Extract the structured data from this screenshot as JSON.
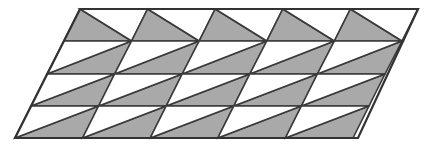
{
  "figure": {
    "title": "Parallelogram tessellation of shaded and unshaded triangles",
    "canvas": {
      "width": 440,
      "height": 148,
      "background": "#ffffff"
    }
  },
  "style": {
    "shaded_fill": "#a9a9a9",
    "unshaded_fill": "#ffffff",
    "stroke": "#3a3a3a",
    "outer_stroke": "#333333",
    "inner_stroke_width": 1.6,
    "outer_stroke_width": 2.2
  },
  "geometry": {
    "outline_points": "80,9 418,9 358,138 15,138",
    "corners": {
      "top_left": [
        80,
        9
      ],
      "top_right": [
        418,
        9
      ],
      "bottom_right": [
        358,
        138
      ],
      "bottom_left": [
        15,
        138
      ]
    },
    "columns": 5,
    "rows": 4,
    "row_y": [
      9,
      41,
      74,
      106,
      138
    ],
    "row_x_left": [
      80,
      64,
      47,
      31,
      15
    ],
    "column_width": 67.6,
    "slant_dx_per_row": -16.25
  },
  "chart_data": {
    "type": "diagram",
    "title": "Parallelogram tessellation of shaded and unshaded triangles",
    "shape": "parallelogram",
    "grid": {
      "columns": 5,
      "rows": 4,
      "cells": 20,
      "triangles": 40
    },
    "shaded_count": 20,
    "unshaded_count": 20,
    "row_patterns": [
      {
        "row": 1,
        "diagonal": "top-left-to-bottom-right",
        "shaded_half": "lower-left"
      },
      {
        "row": 2,
        "diagonal": "bottom-left-to-top-right",
        "shaded_half": "lower-left"
      },
      {
        "row": 3,
        "diagonal": "bottom-left-to-top-right",
        "shaded_half": "lower-left"
      },
      {
        "row": 4,
        "diagonal": "bottom-left-to-top-right",
        "shaded_half": "lower-left"
      }
    ],
    "legend": [
      {
        "label": "shaded triangle",
        "color": "#a9a9a9"
      },
      {
        "label": "unshaded triangle",
        "color": "#ffffff"
      }
    ]
  }
}
